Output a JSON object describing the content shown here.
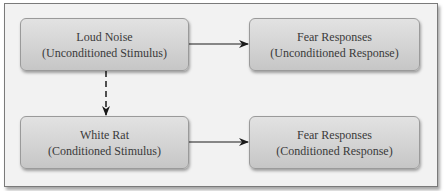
{
  "diagram": {
    "nodes": [
      {
        "id": "ucs",
        "title": "Loud Noise",
        "subtitle": "(Unconditioned Stimulus)"
      },
      {
        "id": "ucr",
        "title": "Fear Responses",
        "subtitle": "(Unconditioned Response)"
      },
      {
        "id": "cs",
        "title": "White Rat",
        "subtitle": "(Conditioned Stimulus)"
      },
      {
        "id": "cr",
        "title": "Fear Responses",
        "subtitle": "(Conditioned Response)"
      }
    ],
    "edges": [
      {
        "from": "ucs",
        "to": "ucr",
        "style": "solid"
      },
      {
        "from": "ucs",
        "to": "cs",
        "style": "dashed"
      },
      {
        "from": "cs",
        "to": "cr",
        "style": "solid"
      }
    ],
    "colors": {
      "frame_bg": "#f2f2f2",
      "frame_border": "#7a7a7a",
      "node_fill_top": "#e2e2e2",
      "node_fill_bottom": "#c6c6c6",
      "text": "#3a3a3a",
      "arrow": "#1a1a1a"
    }
  }
}
